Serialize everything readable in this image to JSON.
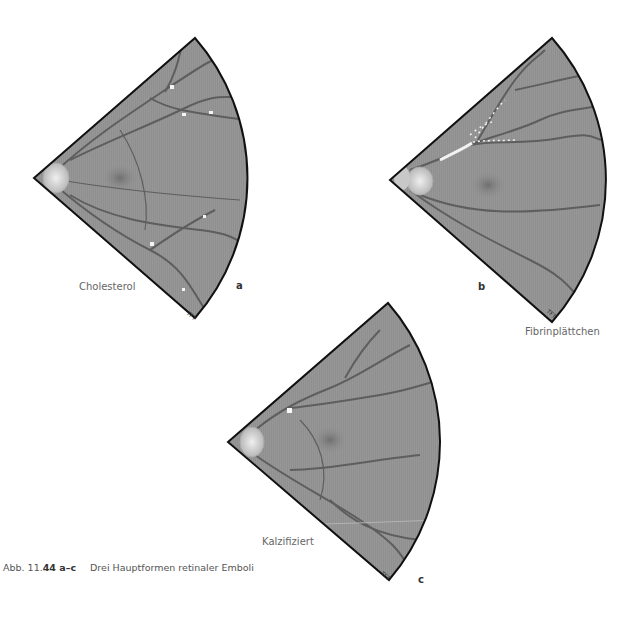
{
  "figure": {
    "panels": [
      {
        "letter": "a",
        "label": "Cholesterol",
        "signature": "TFT"
      },
      {
        "letter": "b",
        "label": "Fibrinplättchen",
        "signature": "TFT"
      },
      {
        "letter": "c",
        "label": "Kalzifiziert",
        "signature": "TFT"
      }
    ],
    "caption": {
      "prefix": "Abb. 11.",
      "number": "44 a–c",
      "text": "Drei Hauptformen retinaler Emboli"
    }
  },
  "colors": {
    "fundus": "#8e8e8e",
    "vessel": "#5a5a5a",
    "outline": "#111111",
    "disc": "#d8d8d8",
    "embolus": "#f4f4f4"
  }
}
